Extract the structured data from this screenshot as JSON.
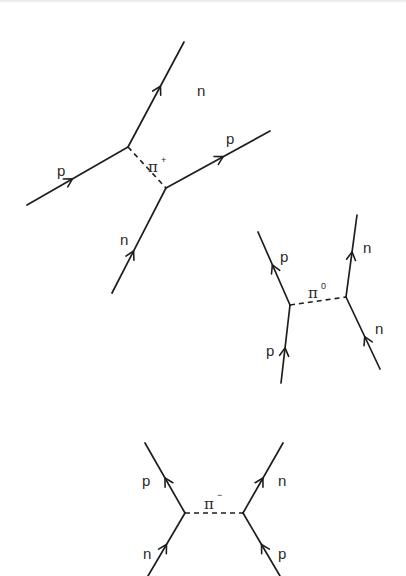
{
  "figure": {
    "stroke_color": "#1e1e1e",
    "label_color": "#2a2a2a"
  },
  "diagrams": [
    {
      "id": "pi-plus-exchange",
      "exchange": {
        "symbol": "π",
        "charge": "+",
        "from": [
          128,
          147
        ],
        "to": [
          166,
          188
        ],
        "label_pos": [
          148,
          172
        ],
        "sup_pos": [
          161,
          163
        ]
      },
      "lines": [
        {
          "particle": "p",
          "from": [
            27,
            205
          ],
          "to": [
            128,
            147
          ],
          "arrow_at": 0.45,
          "label_pos": [
            57,
            176
          ]
        },
        {
          "particle": "n",
          "from": [
            128,
            147
          ],
          "to": [
            184,
            42
          ],
          "arrow_at": 0.58,
          "label_pos": [
            197,
            96
          ]
        },
        {
          "particle": "n",
          "from": [
            112,
            293
          ],
          "to": [
            166,
            188
          ],
          "arrow_at": 0.4,
          "label_pos": [
            120,
            245
          ]
        },
        {
          "particle": "p",
          "from": [
            166,
            188
          ],
          "to": [
            270,
            131
          ],
          "arrow_at": 0.55,
          "label_pos": [
            226,
            144
          ]
        }
      ]
    },
    {
      "id": "pi-zero-exchange",
      "exchange": {
        "symbol": "π",
        "charge": "0",
        "from": [
          290,
          305
        ],
        "to": [
          346,
          297
        ],
        "label_pos": [
          308,
          298
        ],
        "sup_pos": [
          321,
          289
        ]
      },
      "lines": [
        {
          "particle": "p",
          "from": [
            281,
            383
          ],
          "to": [
            290,
            305
          ],
          "arrow_at": 0.45,
          "label_pos": [
            266,
            356
          ]
        },
        {
          "particle": "p",
          "from": [
            290,
            305
          ],
          "to": [
            258,
            232
          ],
          "arrow_at": 0.55,
          "label_pos": [
            280,
            262
          ]
        },
        {
          "particle": "n",
          "from": [
            380,
            369
          ],
          "to": [
            346,
            297
          ],
          "arrow_at": 0.45,
          "label_pos": [
            375,
            334
          ]
        },
        {
          "particle": "n",
          "from": [
            346,
            297
          ],
          "to": [
            357,
            215
          ],
          "arrow_at": 0.55,
          "label_pos": [
            363,
            253
          ]
        }
      ]
    },
    {
      "id": "pi-minus-exchange",
      "exchange": {
        "symbol": "π",
        "charge": "−",
        "from": [
          185,
          513
        ],
        "to": [
          243,
          513
        ],
        "label_pos": [
          204,
          509
        ],
        "sup_pos": [
          217,
          498
        ]
      },
      "lines": [
        {
          "particle": "n",
          "from": [
            148,
            576
          ],
          "to": [
            185,
            513
          ],
          "arrow_at": 0.5,
          "label_pos": [
            143,
            559
          ]
        },
        {
          "particle": "p",
          "from": [
            185,
            513
          ],
          "to": [
            145,
            443
          ],
          "arrow_at": 0.5,
          "label_pos": [
            142,
            486
          ]
        },
        {
          "particle": "p",
          "from": [
            280,
            576
          ],
          "to": [
            243,
            513
          ],
          "arrow_at": 0.5,
          "label_pos": [
            278,
            559
          ]
        },
        {
          "particle": "n",
          "from": [
            243,
            513
          ],
          "to": [
            283,
            443
          ],
          "arrow_at": 0.5,
          "label_pos": [
            278,
            486
          ]
        }
      ]
    }
  ]
}
